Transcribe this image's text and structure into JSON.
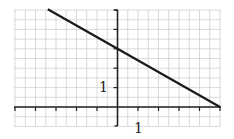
{
  "chart_data": {
    "type": "line",
    "title": "",
    "xlabel": "",
    "ylabel": "",
    "xlim": [
      -5,
      5
    ],
    "ylim": [
      -1,
      5
    ],
    "grid": true,
    "grid_minor_step": 0.5,
    "tick_labels": {
      "x": "1",
      "y": "1"
    },
    "series": [
      {
        "name": "line",
        "points": [
          [
            -3.4,
            5.04
          ],
          [
            0,
            3
          ],
          [
            5,
            0
          ]
        ],
        "equation": "y = 3 - (3/5)x"
      }
    ],
    "colors": {
      "line": "#1a1a1a",
      "grid": "#cfcfcf",
      "axis": "#222222"
    }
  }
}
